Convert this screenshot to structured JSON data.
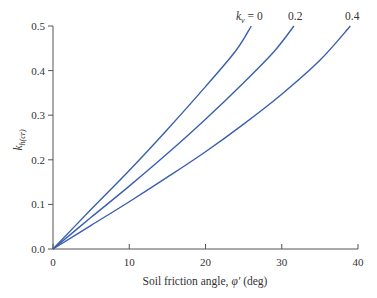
{
  "chart_data": {
    "type": "line",
    "title": "",
    "xlabel": "Soil friction angle, φ′ (deg)",
    "ylabel": "k_h(cr)",
    "xlim": [
      0,
      40
    ],
    "ylim": [
      0,
      0.5
    ],
    "x_ticks": [
      "0",
      "10",
      "20",
      "30",
      "40"
    ],
    "y_ticks": [
      "0.0",
      "0.1",
      "0.2",
      "0.3",
      "0.4",
      "0.5"
    ],
    "grid": false,
    "legend": "inline labels at curve ends",
    "series": [
      {
        "name": "k_v = 0",
        "label": "k_v = 0",
        "x": [
          0,
          5,
          10,
          15,
          20,
          24,
          26
        ],
        "y": [
          0,
          0.089,
          0.176,
          0.268,
          0.364,
          0.445,
          0.5
        ]
      },
      {
        "name": "k_v = 0.2",
        "label": "0.2",
        "x": [
          0,
          5,
          10,
          15,
          20,
          25,
          29,
          31.6
        ],
        "y": [
          0,
          0.071,
          0.141,
          0.214,
          0.291,
          0.373,
          0.443,
          0.5
        ]
      },
      {
        "name": "k_v = 0.4",
        "label": "0.4",
        "x": [
          0,
          5,
          10,
          15,
          20,
          25,
          30,
          35,
          39
        ],
        "y": [
          0,
          0.053,
          0.106,
          0.161,
          0.218,
          0.28,
          0.347,
          0.423,
          0.5
        ]
      }
    ],
    "line_color": "#3a5fb0"
  },
  "labels": {
    "xlabel_prefix": "Soil friction angle, ",
    "xlabel_phi": "φ′",
    "xlabel_suffix": " (deg)",
    "ylabel_main": "k",
    "ylabel_sub": "h(cr)",
    "kv0_main": "k",
    "kv0_sub": "v",
    "kv0_rest": " = 0",
    "kv02": "0.2",
    "kv04": "0.4"
  }
}
